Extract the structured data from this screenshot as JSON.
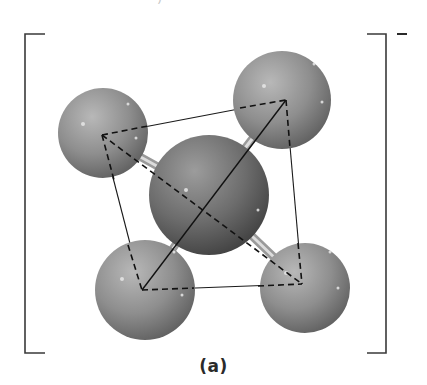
{
  "top_text": "— — — — — — — —)",
  "caption": "(a)",
  "charge": "−",
  "colors": {
    "line": "#1a1a1a",
    "bracket": "#3a3a3a",
    "sphere_light": "#b4b4b4",
    "sphere_mid": "#8a8a8a",
    "sphere_dark": "#5a5a5a",
    "center_light": "#9a9a9a",
    "center_dark": "#3e3e3e",
    "rod_light": "#d8d8d8",
    "rod_dark": "#8c8c8c"
  },
  "molecule": {
    "description": "Tetrahedral ion inside brackets: central atom bonded to four outer atoms, with tetrahedron edges drawn (solid front edges, dashed rear edges)",
    "center_atom": {
      "cx": 209,
      "cy": 195,
      "r": 60
    },
    "outer_atoms": [
      {
        "name": "top-left",
        "cx": 103,
        "cy": 133,
        "r": 45,
        "vx": 102,
        "vy": 135
      },
      {
        "name": "top-right",
        "cx": 282,
        "cy": 100,
        "r": 49,
        "vx": 286,
        "vy": 100
      },
      {
        "name": "bottom-left",
        "cx": 145,
        "cy": 290,
        "r": 50,
        "vx": 142,
        "vy": 290
      },
      {
        "name": "bottom-right",
        "cx": 305,
        "cy": 288,
        "r": 45,
        "vx": 302,
        "vy": 284
      }
    ]
  }
}
